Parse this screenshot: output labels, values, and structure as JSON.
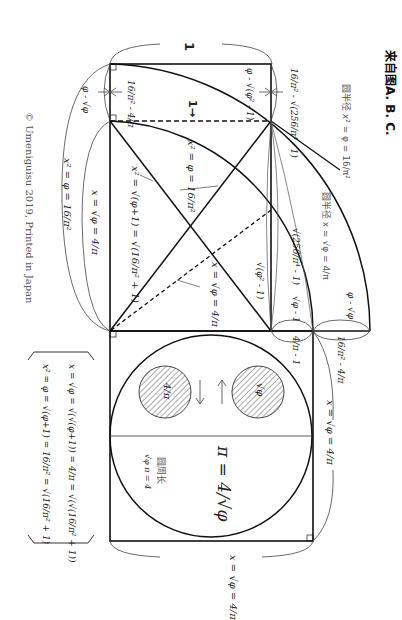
{
  "caption": "来自图A. B. C.",
  "copyright": "© Umeniguisu 2019, Printed in Japan",
  "colors": {
    "line": "#111111",
    "thin_line": "#444444",
    "hatch": "#555555",
    "text": "#222222",
    "background": "#ffffff"
  },
  "labels": {
    "unit_top": "1",
    "unit_arrow": "1→",
    "left_gap": "φ - √φ",
    "top_rect_inner_left": "16/π² - 4/π",
    "top_rect_inner_right": "φ - √(φ² - 1)",
    "right_top_gap": "16/π² - √(256/π⁴ - 1)",
    "radius_outer": "圆半径 x² = φ = 16/π²",
    "radius_inner": "圆半径 x = √φ = 4/π",
    "diag_upper": "x² = φ = 16/π²",
    "diag_left": "x² = √(φ+1) = √(16/π² + 1)",
    "diag_dashed": "x = √φ = 4/π",
    "mid_right_a": "√(256/π⁴ - 1)",
    "mid_right_b": "√(φ² - 1)",
    "mid_right_c": "√φ - 1",
    "mid_right_d": "4/π - 1",
    "far_right_gap": "φ - √φ",
    "far_right_gap2": "16/π² - 4/π",
    "left_x_sqrt": "x = √φ = 4/π",
    "left_x_sq": "x² = φ = 16/π²",
    "right_side_x": "x = √φ = 4/π",
    "bottom_x": "x = √φ = 4/π",
    "circle_left": "4/π",
    "circle_right": "√φ",
    "pi_formula": "π = 4/√φ",
    "circumference_cn": "圆周长",
    "circumference_eq": "√φ π = 4"
  },
  "formula_box": {
    "line1": "x = √φ = √(√(φ+1)) = 4/π = √(√(16/π² + 1))",
    "line2": "x² = φ = √(φ+1) = 16/π² = √(16/π² + 1)"
  }
}
